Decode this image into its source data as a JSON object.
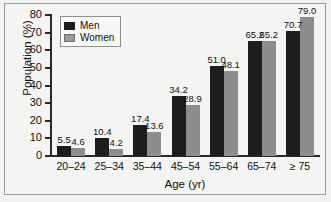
{
  "chart_data": {
    "type": "bar",
    "title": "",
    "xlabel": "Age (yr)",
    "ylabel": "Population (%)",
    "categories": [
      "20–24",
      "25–34",
      "35–44",
      "45–54",
      "55–64",
      "65–74",
      "≥ 75"
    ],
    "series": [
      {
        "name": "Men",
        "color": "#1d1d1d",
        "values": [
          5.5,
          10.4,
          17.4,
          34.2,
          51.0,
          65.2,
          70.7
        ]
      },
      {
        "name": "Women",
        "color": "#8d8d8d",
        "values": [
          4.6,
          4.2,
          13.6,
          28.9,
          48.1,
          65.2,
          79.0
        ]
      }
    ],
    "data_labels": {
      "men": [
        "5.5",
        "10.4",
        "17.4",
        "34.2",
        "51.0",
        "65.2",
        "70.7"
      ],
      "women": [
        "4.6",
        "4.2",
        "13.6",
        "28.9",
        "48.1",
        "65.2",
        "79.0"
      ]
    },
    "ylim": [
      0,
      80
    ],
    "yticks": [
      0,
      10,
      20,
      30,
      40,
      50,
      60,
      70,
      80
    ],
    "ytick_labels": [
      "0",
      "10",
      "20",
      "30",
      "40",
      "50",
      "60",
      "70",
      "80"
    ],
    "grid": false,
    "legend_position": "upper left"
  },
  "legend": {
    "entries": [
      {
        "label": "Men"
      },
      {
        "label": "Women"
      }
    ]
  },
  "axes": {
    "x_title": "Age (yr)",
    "y_title": "Population (%)"
  }
}
